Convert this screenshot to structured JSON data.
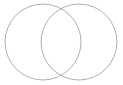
{
  "figure": {
    "name": "two-set-venn-diagram",
    "width": 123,
    "height": 85,
    "background_color": "#ffffff",
    "fill": "none",
    "stroke_color": "#9a9a9a",
    "stroke_width": 0.8,
    "labels_visible": false,
    "title": "",
    "caption": ""
  },
  "chart_data": {
    "type": "diagram",
    "subtype": "venn",
    "title": "",
    "xlabel": "",
    "ylabel": "",
    "grid": false,
    "legend": false,
    "sets": [
      {
        "id": "set-a",
        "label": "",
        "cx": 43,
        "cy": 42,
        "r": 38,
        "fill": "none",
        "stroke": "#9a9a9a"
      },
      {
        "id": "set-b",
        "label": "",
        "cx": 79,
        "cy": 42,
        "r": 38,
        "fill": "none",
        "stroke": "#9a9a9a"
      }
    ],
    "intersection_points": [
      {
        "x": 61,
        "y": 8
      },
      {
        "x": 61,
        "y": 75
      }
    ],
    "region_labels": []
  }
}
